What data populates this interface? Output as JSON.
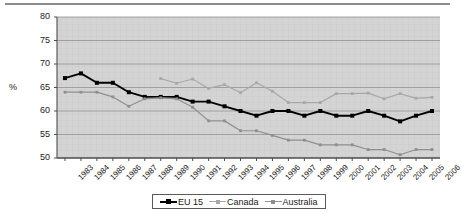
{
  "axes": {
    "ylabel": "%",
    "yticks": [
      "80",
      "75",
      "70",
      "65",
      "60",
      "55",
      "50"
    ],
    "xticks": [
      "1983",
      "1984",
      "1985",
      "1986",
      "1987",
      "1988",
      "1989",
      "1990",
      "1991",
      "1992",
      "1993",
      "1994",
      "1995",
      "1996",
      "1997",
      "1998",
      "1999",
      "2000",
      "2001",
      "2002",
      "2003",
      "2004",
      "2005",
      "2006"
    ]
  },
  "legend": {
    "items": [
      {
        "label": "EU 15",
        "color": "#000000",
        "marker": "square"
      },
      {
        "label": "Canada",
        "color": "#a8a8a8",
        "marker": "square"
      },
      {
        "label": "Australia",
        "color": "#8f8f8f",
        "marker": "square"
      }
    ]
  },
  "colors": {
    "eu15": "#000000",
    "canada": "#a8a8a8",
    "australia": "#8f8f8f",
    "plot_background": "#d4d4d4",
    "gridline": "#9a9a9a",
    "axis": "#4d4d4d"
  },
  "chart_data": {
    "type": "line",
    "title": "",
    "xlabel": "",
    "ylabel": "%",
    "ylim": [
      50,
      80
    ],
    "ytick_step": 5,
    "grid": true,
    "legend_position": "bottom",
    "x": [
      "1983",
      "1984",
      "1985",
      "1986",
      "1987",
      "1988",
      "1989",
      "1990",
      "1991",
      "1992",
      "1993",
      "1994",
      "1995",
      "1996",
      "1997",
      "1998",
      "1999",
      "2000",
      "2001",
      "2002",
      "2003",
      "2004",
      "2005",
      "2006"
    ],
    "series": [
      {
        "name": "EU 15",
        "color": "#000000",
        "values": [
          67.0,
          68.0,
          66.0,
          66.0,
          64.0,
          63.0,
          63.0,
          63.0,
          62.0,
          62.0,
          61.0,
          60.0,
          59.0,
          60.0,
          60.0,
          59.0,
          60.0,
          59.0,
          59.0,
          60.0,
          59.0,
          57.8,
          59.0,
          60.0
        ]
      },
      {
        "name": "Canada",
        "color": "#a8a8a8",
        "values": [
          null,
          null,
          null,
          null,
          null,
          null,
          66.9,
          65.9,
          66.8,
          64.8,
          65.6,
          63.9,
          66.0,
          64.2,
          61.8,
          61.8,
          61.8,
          63.7,
          63.7,
          63.8,
          62.6,
          63.7,
          62.7,
          62.9
        ]
      },
      {
        "name": "Australia",
        "color": "#8f8f8f",
        "values": [
          64.0,
          64.0,
          64.0,
          63.0,
          61.0,
          62.6,
          62.8,
          62.6,
          60.8,
          57.9,
          57.9,
          55.8,
          55.8,
          54.8,
          53.8,
          53.8,
          52.8,
          52.8,
          52.8,
          51.8,
          51.8,
          50.7,
          51.8,
          51.8
        ]
      }
    ]
  }
}
